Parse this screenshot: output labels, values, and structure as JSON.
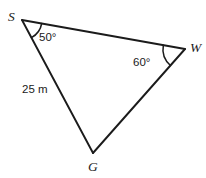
{
  "figure": {
    "type": "triangle-diagram",
    "background_color": "#ffffff",
    "line_color": "#1b1b1b",
    "vertices": {
      "S": {
        "label": "S",
        "x": 22,
        "y": 20
      },
      "W": {
        "label": "W",
        "x": 185,
        "y": 49
      },
      "G": {
        "label": "G",
        "x": 93,
        "y": 153
      }
    },
    "vertex_labels": {
      "S": {
        "text": "S",
        "x": 8,
        "y": 21
      },
      "W": {
        "text": "W",
        "x": 190,
        "y": 52
      },
      "G": {
        "text": "G",
        "x": 88,
        "y": 171
      }
    },
    "angles": [
      {
        "at": "S",
        "text": "50°",
        "value": 50,
        "unit": "degrees",
        "label_x": 39,
        "label_y": 41,
        "arc_radius": 20
      },
      {
        "at": "W",
        "text": "60°",
        "value": 60,
        "unit": "degrees",
        "label_x": 133,
        "label_y": 66,
        "arc_radius": 22
      }
    ],
    "side_labels": [
      {
        "side": "SG",
        "text": "25 m",
        "value": 25,
        "unit": "m",
        "label_x": 22,
        "label_y": 93
      }
    ],
    "edges": [
      {
        "name": "SW",
        "from": "S",
        "to": "W"
      },
      {
        "name": "SG",
        "from": "S",
        "to": "G"
      },
      {
        "name": "GW",
        "from": "G",
        "to": "W"
      }
    ]
  }
}
